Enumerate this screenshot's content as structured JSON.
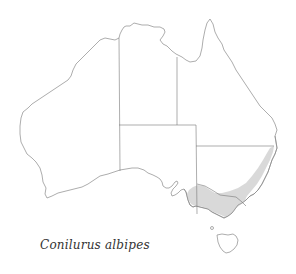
{
  "map": {
    "region": "Australia",
    "species_caption": "Conilurus albipes",
    "range_description": "south-eastern Australia: eastern New South Wales coast and Victoria",
    "colors": {
      "range_fill": "#d9d9d9",
      "outline": "#8a8a8a",
      "background": "#ffffff"
    }
  }
}
